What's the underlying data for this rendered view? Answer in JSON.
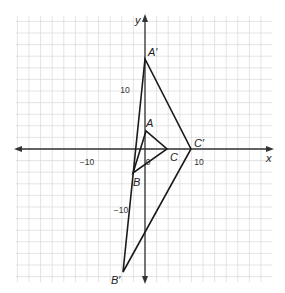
{
  "diagram": {
    "type": "coordinate-grid-dilation",
    "grid": {
      "x_min": -22,
      "x_max": 22,
      "y_min": -24,
      "y_max": 22,
      "step_units": 2,
      "px_per_unit": 5.8,
      "origin_px": [
        145,
        149
      ],
      "color": "#d9d9d9"
    },
    "axes": {
      "x_label": "x",
      "y_label": "y",
      "color": "#333333"
    },
    "ticks": [
      {
        "label": "−10",
        "x": 87,
        "y": 165
      },
      {
        "label": "0",
        "x": 148,
        "y": 165
      },
      {
        "label": "10",
        "x": 199,
        "y": 165
      },
      {
        "label": "10",
        "x": 125,
        "y": 93
      },
      {
        "label": "−10",
        "x": 121,
        "y": 213
      }
    ],
    "points": {
      "A": {
        "label": "A",
        "coord": [
          0,
          3
        ],
        "px": [
          146,
          131
        ]
      },
      "B": {
        "label": "B",
        "coord": [
          -2,
          -4
        ],
        "px": [
          133,
          173
        ]
      },
      "C": {
        "label": "C",
        "coord": [
          4,
          0
        ],
        "px": [
          167,
          149
        ]
      },
      "A'": {
        "label": "A′",
        "coord": [
          0,
          15
        ],
        "px": [
          145,
          59
        ]
      },
      "B'": {
        "label": "B′",
        "coord": [
          -4,
          -21
        ],
        "px": [
          123,
          272
        ]
      },
      "C'": {
        "label": "C′",
        "coord": [
          8,
          0
        ],
        "px": [
          191,
          149
        ]
      }
    },
    "triangles": [
      {
        "name": "ABC",
        "vertices": [
          "A",
          "B",
          "C"
        ]
      },
      {
        "name": "A'B'C'",
        "vertices": [
          "A'",
          "B'",
          "C'"
        ]
      }
    ],
    "line_color": "#1a1a1a"
  }
}
